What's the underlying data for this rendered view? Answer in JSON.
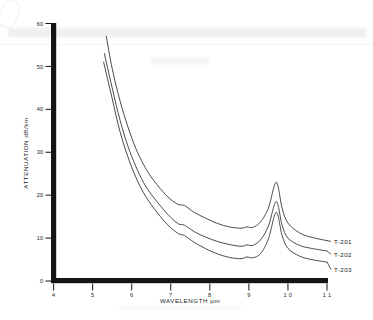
{
  "figure": {
    "title": "",
    "background_color": "#ffffff",
    "ink_color": "#2b2b2b"
  },
  "axes": {
    "x": {
      "label": "WAVELENGTH",
      "unit": "µm",
      "label_full": "WAVELENGTH µm",
      "ticks": [
        "4",
        "5",
        "6",
        "7",
        "8",
        "9",
        "1 0",
        "1 1"
      ],
      "tick_values": [
        4,
        5,
        6,
        7,
        8,
        9,
        10,
        11
      ],
      "range": [
        4,
        11
      ]
    },
    "y": {
      "label": "ATTENUATION dB/km",
      "ticks": [
        "0",
        "10",
        "20",
        "30",
        "40",
        "50",
        "60"
      ],
      "tick_values": [
        0,
        10,
        20,
        30,
        40,
        50,
        60
      ],
      "range": [
        0,
        60
      ]
    }
  },
  "legend": {
    "position": "right-inline",
    "entries": [
      {
        "label": "T-201"
      },
      {
        "label": "T-202"
      },
      {
        "label": "T-203"
      }
    ]
  },
  "chart_data": {
    "type": "line",
    "title": "",
    "xlabel": "WAVELENGTH µm",
    "ylabel": "ATTENUATION dB/km",
    "xlim": [
      4,
      11
    ],
    "ylim": [
      0,
      60
    ],
    "grid": false,
    "legend_position": "right-inline",
    "annotations": [
      "absorption peak near 9.7 µm on all three samples",
      "minor shoulder near 7.2 µm",
      "minor bump near 8.9 µm"
    ],
    "series": [
      {
        "name": "T-201",
        "x": [
          5.35,
          5.5,
          5.7,
          5.9,
          6.1,
          6.3,
          6.5,
          6.8,
          7.0,
          7.2,
          7.35,
          7.6,
          7.9,
          8.2,
          8.5,
          8.8,
          8.95,
          9.1,
          9.3,
          9.5,
          9.7,
          9.85,
          10.0,
          10.3,
          10.6,
          11.0
        ],
        "y": [
          57.0,
          49.5,
          42.0,
          36.0,
          31.0,
          27.2,
          24.2,
          20.8,
          19.0,
          17.8,
          17.6,
          16.0,
          14.6,
          13.4,
          12.6,
          12.3,
          12.6,
          12.5,
          13.8,
          17.0,
          23.0,
          17.0,
          13.5,
          11.2,
          10.2,
          9.4
        ]
      },
      {
        "name": "T-202",
        "x": [
          5.3,
          5.5,
          5.7,
          5.9,
          6.1,
          6.3,
          6.5,
          6.8,
          7.0,
          7.2,
          7.35,
          7.6,
          7.9,
          8.2,
          8.5,
          8.8,
          8.95,
          9.1,
          9.3,
          9.5,
          9.7,
          9.85,
          10.0,
          10.3,
          10.6,
          11.0
        ],
        "y": [
          53.0,
          45.0,
          37.5,
          31.5,
          26.8,
          23.0,
          20.2,
          16.8,
          14.8,
          13.3,
          13.0,
          11.5,
          10.2,
          9.2,
          8.5,
          8.1,
          8.4,
          8.3,
          9.6,
          12.8,
          18.5,
          13.0,
          10.0,
          8.3,
          7.6,
          7.0
        ]
      },
      {
        "name": "T-203",
        "x": [
          5.28,
          5.5,
          5.7,
          5.9,
          6.1,
          6.3,
          6.5,
          6.8,
          7.0,
          7.2,
          7.35,
          7.6,
          7.9,
          8.2,
          8.5,
          8.8,
          8.95,
          9.1,
          9.3,
          9.5,
          9.7,
          9.85,
          10.0,
          10.3,
          10.6,
          11.0
        ],
        "y": [
          51.0,
          42.5,
          34.8,
          29.0,
          24.3,
          20.6,
          17.8,
          14.3,
          12.4,
          11.0,
          10.6,
          9.0,
          7.5,
          6.3,
          5.5,
          5.2,
          5.6,
          5.4,
          6.4,
          9.8,
          16.0,
          10.6,
          7.6,
          5.8,
          5.0,
          4.4
        ]
      }
    ]
  }
}
